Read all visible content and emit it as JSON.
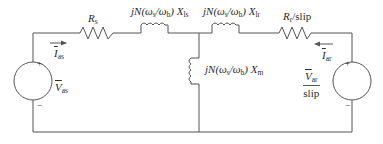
{
  "diagram": {
    "type": "circuit",
    "components": {
      "stator_resistance": {
        "symbol": "R",
        "subscript": "s"
      },
      "stator_leakage": {
        "prefix": "jN(ω",
        "sub1": "s",
        "mid": "/ω",
        "sub2": "b",
        "suffix": ") X",
        "sub3": "ls"
      },
      "rotor_leakage": {
        "prefix": "jN(ω",
        "sub1": "s",
        "mid": "/ω",
        "sub2": "b",
        "suffix": ") X",
        "sub3": "lr"
      },
      "magnetizing": {
        "prefix": "jN(ω",
        "sub1": "s",
        "mid": "/ω",
        "sub2": "b",
        "suffix": ") X",
        "sub3": "m"
      },
      "rotor_resistance": {
        "symbol": "R",
        "subscript": "r",
        "suffix": "/slip"
      }
    },
    "sources": {
      "stator": {
        "voltage": "V",
        "voltage_sub": "as",
        "current": "I",
        "current_sub": "as",
        "plus": "+",
        "minus": "−"
      },
      "rotor": {
        "voltage": "V",
        "voltage_sub": "ar",
        "denominator": "slip",
        "current": "I",
        "current_sub": "ar",
        "plus": "+",
        "minus": "−"
      }
    },
    "colors": {
      "wire": "#555555",
      "text": "#2a2a2a",
      "background": "#ffffff"
    }
  }
}
